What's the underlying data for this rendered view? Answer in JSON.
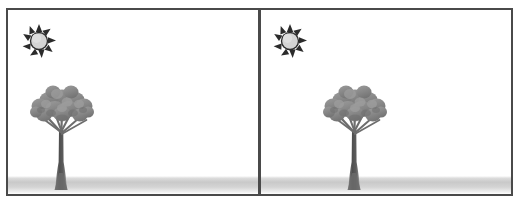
{
  "scene": {
    "title": "Two-panel outdoor scene comparison",
    "panel_count": 2,
    "background_color": "#ffffff",
    "border_color": "#4a4a4a",
    "ground_color": "#c9c9c9",
    "sun_body_color": "#d0d0d0",
    "sun_outline_color": "#2b2b2b",
    "tree_canopy_color": "#8a8a8a",
    "tree_trunk_color": "#5e5e5e"
  },
  "panels": [
    {
      "id": "panel-left",
      "name": "left-panel",
      "sun": {
        "icon": "sun-icon",
        "label": "Sun",
        "x": 14,
        "y": 14,
        "size": 34,
        "ray_count": 9
      },
      "tree": {
        "icon": "tree-icon",
        "label": "Tree",
        "x": 16,
        "y": 68,
        "width": 76,
        "height": 112
      },
      "ground": {
        "label": "Ground",
        "height": 18
      }
    },
    {
      "id": "panel-right",
      "name": "right-panel",
      "sun": {
        "icon": "sun-icon",
        "label": "Sun",
        "x": 12,
        "y": 14,
        "size": 34,
        "ray_count": 9
      },
      "tree": {
        "icon": "tree-icon",
        "label": "Tree",
        "x": 56,
        "y": 68,
        "width": 76,
        "height": 112
      },
      "ground": {
        "label": "Ground",
        "height": 18
      }
    }
  ]
}
